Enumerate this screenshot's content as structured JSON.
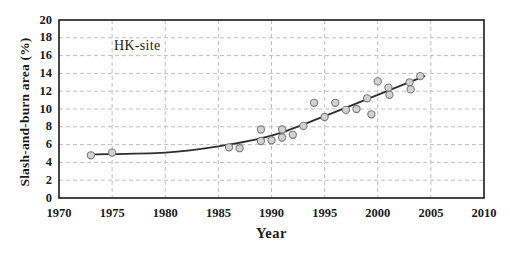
{
  "chart_data": {
    "type": "scatter",
    "title": "",
    "site_label": "HK-site",
    "xlabel": "Year",
    "ylabel": "Slash-and-burn area (%)",
    "xlim": [
      1970,
      2010
    ],
    "ylim": [
      0,
      20
    ],
    "x_ticks": [
      1970,
      1975,
      1980,
      1985,
      1990,
      1995,
      2000,
      2005,
      2010
    ],
    "y_ticks": [
      0,
      2,
      4,
      6,
      8,
      10,
      12,
      14,
      16,
      18,
      20
    ],
    "grid": "dashed-both-axes",
    "legend": "none",
    "series": [
      {
        "name": "slash-and-burn-observations",
        "marker": "circle",
        "points": [
          {
            "year": 1973,
            "value": 4.8
          },
          {
            "year": 1975,
            "value": 5.1
          },
          {
            "year": 1986,
            "value": 5.7
          },
          {
            "year": 1987,
            "value": 5.6
          },
          {
            "year": 1989,
            "value": 6.4
          },
          {
            "year": 1989,
            "value": 7.7
          },
          {
            "year": 1990,
            "value": 6.5
          },
          {
            "year": 1991,
            "value": 6.8
          },
          {
            "year": 1991,
            "value": 7.7
          },
          {
            "year": 1992,
            "value": 7.1
          },
          {
            "year": 1993,
            "value": 8.1
          },
          {
            "year": 1994,
            "value": 10.7
          },
          {
            "year": 1995,
            "value": 9.1
          },
          {
            "year": 1996,
            "value": 10.7
          },
          {
            "year": 1997,
            "value": 9.9
          },
          {
            "year": 1998,
            "value": 10.0
          },
          {
            "year": 1999,
            "value": 11.2
          },
          {
            "year": 1999.4,
            "value": 9.4
          },
          {
            "year": 2000,
            "value": 13.1
          },
          {
            "year": 2001,
            "value": 12.4
          },
          {
            "year": 2001.1,
            "value": 11.6
          },
          {
            "year": 2003,
            "value": 13.0
          },
          {
            "year": 2003.1,
            "value": 12.2
          },
          {
            "year": 2004,
            "value": 13.7
          }
        ]
      }
    ],
    "trend_line": {
      "name": "fitted-trend-curve",
      "anchors": [
        {
          "year": 1973,
          "value": 4.9
        },
        {
          "year": 1980,
          "value": 5.1
        },
        {
          "year": 1985,
          "value": 5.8
        },
        {
          "year": 1990,
          "value": 7.0
        },
        {
          "year": 1995,
          "value": 9.2
        },
        {
          "year": 2000,
          "value": 11.6
        },
        {
          "year": 2004.4,
          "value": 13.7
        }
      ]
    }
  },
  "style": {
    "background": "#ffffff",
    "frame_color": "#1a1a1a",
    "grid_color": "#b8b8b8",
    "trend_color": "#2e2e2e",
    "point_fill": "#d2d2d2",
    "point_stroke": "#7d7d7d",
    "text_color": "#1a1a1a"
  }
}
